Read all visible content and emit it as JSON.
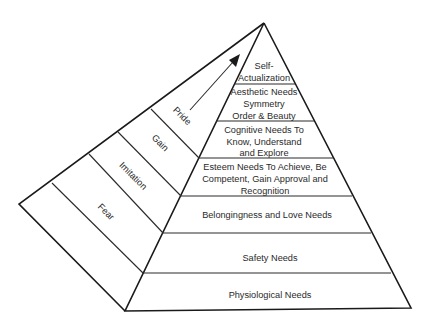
{
  "diagram": {
    "type": "pyramid",
    "title": "",
    "colors": {
      "line": "#1a1a1a",
      "text": "#2a2a2a",
      "background": "#ffffff"
    },
    "front_face": {
      "levels": [
        {
          "id": "self-actualization",
          "lines": [
            "Self-",
            "Actualization"
          ]
        },
        {
          "id": "aesthetic",
          "lines": [
            "Aesthetic Needs",
            "Symmetry",
            "Order & Beauty"
          ]
        },
        {
          "id": "cognitive",
          "lines": [
            "Cognitive Needs To",
            "Know, Understand",
            "and Explore"
          ]
        },
        {
          "id": "esteem",
          "lines": [
            "Esteem Needs To Achieve, Be",
            "Competent, Gain Approval and",
            "Recognition"
          ]
        },
        {
          "id": "belongingness",
          "lines": [
            "Belongingness and Love Needs"
          ]
        },
        {
          "id": "safety",
          "lines": [
            "Safety Needs"
          ]
        },
        {
          "id": "physiological",
          "lines": [
            "Physiological Needs"
          ]
        }
      ]
    },
    "side_face": {
      "labels": [
        "Pride",
        "Gain",
        "Imitation",
        "Fear"
      ],
      "arrow": "arrow-up-right"
    }
  }
}
